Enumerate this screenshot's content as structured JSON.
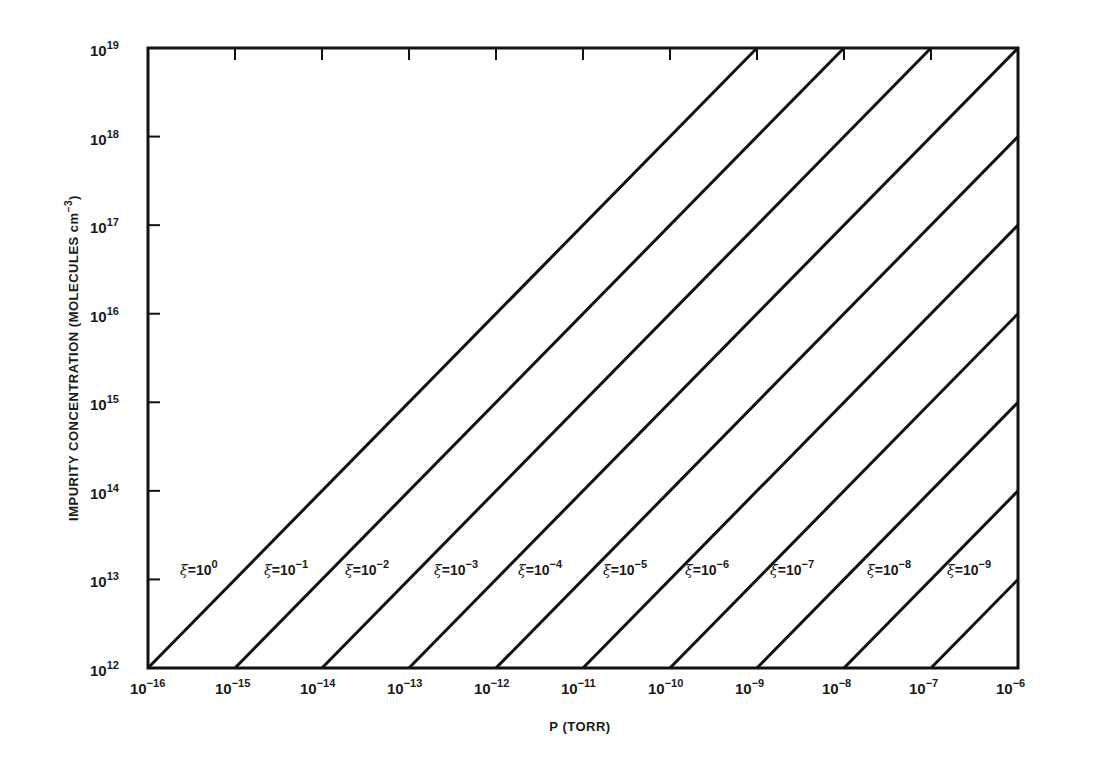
{
  "chart_data": {
    "type": "line",
    "title": "",
    "xlabel": "P (TORR)",
    "ylabel": "IMPURITY CONCENTRATION (MOLECULES cm^-3)",
    "xscale": "log",
    "yscale": "log",
    "xlim": [
      1e-16,
      1e-06
    ],
    "ylim": [
      1000000000000.0,
      1e+19
    ],
    "grid": false,
    "legend_position": "inline labels near lower-left of each line",
    "x_ticks": [
      {
        "base": "10",
        "exp": "−16",
        "value": 1e-16
      },
      {
        "base": "10",
        "exp": "−15",
        "value": 1e-15
      },
      {
        "base": "10",
        "exp": "−14",
        "value": 1e-14
      },
      {
        "base": "10",
        "exp": "−13",
        "value": 1e-13
      },
      {
        "base": "10",
        "exp": "−12",
        "value": 1e-12
      },
      {
        "base": "10",
        "exp": "−11",
        "value": 1e-11
      },
      {
        "base": "10",
        "exp": "−10",
        "value": 1e-10
      },
      {
        "base": "10",
        "exp": "−9",
        "value": 1e-09
      },
      {
        "base": "10",
        "exp": "−8",
        "value": 1e-08
      },
      {
        "base": "10",
        "exp": "−7",
        "value": 1e-07
      },
      {
        "base": "10",
        "exp": "−6",
        "value": 1e-06
      }
    ],
    "y_ticks": [
      {
        "base": "10",
        "exp": "12",
        "value": 1000000000000.0
      },
      {
        "base": "10",
        "exp": "13",
        "value": 10000000000000.0
      },
      {
        "base": "10",
        "exp": "14",
        "value": 100000000000000.0
      },
      {
        "base": "10",
        "exp": "15",
        "value": 1000000000000000.0
      },
      {
        "base": "10",
        "exp": "16",
        "value": 1e+16
      },
      {
        "base": "10",
        "exp": "17",
        "value": 1e+17
      },
      {
        "base": "10",
        "exp": "18",
        "value": 1e+18
      },
      {
        "base": "10",
        "exp": "19",
        "value": 1e+19
      }
    ],
    "series": [
      {
        "name": "ξ=10^0",
        "xi": 1.0,
        "label_exp": "0",
        "x": [
          1e-16,
          1e-09
        ],
        "y": [
          1000000000000.0,
          1e+19
        ]
      },
      {
        "name": "ξ=10^-1",
        "xi": 0.1,
        "label_exp": "−1",
        "x": [
          1e-15,
          1e-08
        ],
        "y": [
          1000000000000.0,
          1e+19
        ]
      },
      {
        "name": "ξ=10^-2",
        "xi": 0.01,
        "label_exp": "−2",
        "x": [
          1e-14,
          1e-07
        ],
        "y": [
          1000000000000.0,
          1e+19
        ]
      },
      {
        "name": "ξ=10^-3",
        "xi": 0.001,
        "label_exp": "−3",
        "x": [
          1e-13,
          1e-06
        ],
        "y": [
          1000000000000.0,
          1e+19
        ]
      },
      {
        "name": "ξ=10^-4",
        "xi": 0.0001,
        "label_exp": "−4",
        "x": [
          1e-12,
          1e-06
        ],
        "y": [
          1000000000000.0,
          1e+18
        ]
      },
      {
        "name": "ξ=10^-5",
        "xi": 1e-05,
        "label_exp": "−5",
        "x": [
          1e-11,
          1e-06
        ],
        "y": [
          1000000000000.0,
          1e+17
        ]
      },
      {
        "name": "ξ=10^-6",
        "xi": 1e-06,
        "label_exp": "−6",
        "x": [
          1e-10,
          1e-06
        ],
        "y": [
          1000000000000.0,
          1e+16
        ]
      },
      {
        "name": "ξ=10^-7",
        "xi": 1e-07,
        "label_exp": "−7",
        "x": [
          1e-09,
          1e-06
        ],
        "y": [
          1000000000000.0,
          1000000000000000.0
        ]
      },
      {
        "name": "ξ=10^-8",
        "xi": 1e-08,
        "label_exp": "−8",
        "x": [
          1e-08,
          1e-06
        ],
        "y": [
          1000000000000.0,
          100000000000000.0
        ]
      },
      {
        "name": "ξ=10^-9",
        "xi": 1e-09,
        "label_exp": "−9",
        "x": [
          1e-07,
          1e-06
        ],
        "y": [
          1000000000000.0,
          10000000000000.0
        ]
      }
    ],
    "annotations": [
      {
        "text": "ξ=10^0",
        "x_px": 180,
        "y_px": 575
      },
      {
        "text": "ξ=10^-1",
        "x_px": 264,
        "y_px": 575
      },
      {
        "text": "ξ=10^-2",
        "x_px": 345,
        "y_px": 575
      },
      {
        "text": "ξ=10^-3",
        "x_px": 434,
        "y_px": 575
      },
      {
        "text": "ξ=10^-4",
        "x_px": 518,
        "y_px": 575
      },
      {
        "text": "ξ=10^-5",
        "x_px": 603,
        "y_px": 575
      },
      {
        "text": "ξ=10^-6",
        "x_px": 685,
        "y_px": 575
      },
      {
        "text": "ξ=10^-7",
        "x_px": 770,
        "y_px": 575
      },
      {
        "text": "ξ=10^-8",
        "x_px": 867,
        "y_px": 575
      },
      {
        "text": "ξ=10^-9",
        "x_px": 947,
        "y_px": 575
      }
    ]
  },
  "labels": {
    "xlabel": "P (TORR)",
    "ylabel_main": "IMPURITY CONCENTRATION (MOLECULES cm",
    "ylabel_sup": "−3",
    "ylabel_close": ")",
    "xi_symbol": "ξ",
    "equals_ten": "=10"
  },
  "style": {
    "line_color": "#111111",
    "background": "#ffffff"
  }
}
